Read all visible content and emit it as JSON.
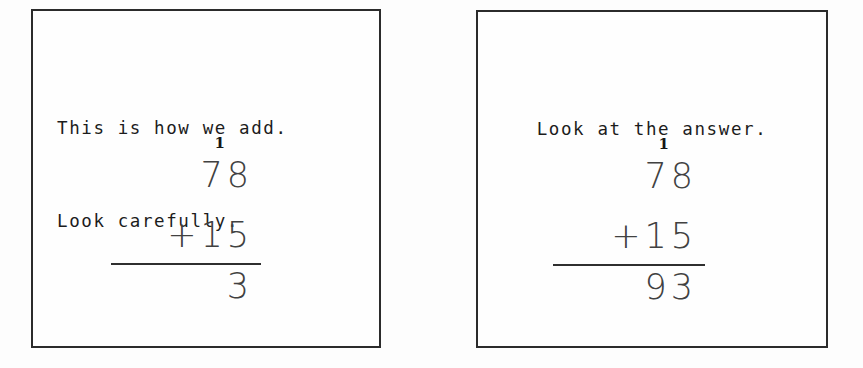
{
  "page": {
    "background_color": "#fdfdfd",
    "ink_color": "#2b2b2b"
  },
  "panels": [
    {
      "id": "left",
      "caption_lines": [
        "This is how we add.",
        "Look carefully."
      ],
      "problem": {
        "carry": "1",
        "addend_top": "78",
        "operator": "+",
        "addend_bottom": "15",
        "operand_row": "+15",
        "result": "3"
      }
    },
    {
      "id": "right",
      "caption_lines": [
        "Look at the answer."
      ],
      "problem": {
        "carry": "1",
        "addend_top": "78",
        "operator": "+",
        "addend_bottom": "15",
        "operand_row": "+15",
        "result": "93"
      }
    }
  ]
}
